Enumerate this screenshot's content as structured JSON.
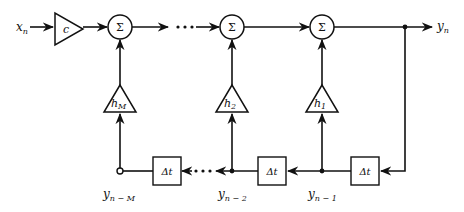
{
  "diagram": {
    "input_label": "x",
    "input_sub": "n",
    "output_label": "y",
    "output_sub": "n",
    "gain_label": "c",
    "sum_symbol": "Σ",
    "delay_label": "Δt",
    "ellipsis": "···",
    "coefficients": [
      {
        "name": "h",
        "sub": "M"
      },
      {
        "name": "h",
        "sub": "2"
      },
      {
        "name": "h",
        "sub": "1"
      }
    ],
    "taps": [
      {
        "name": "y",
        "sub": "n − M"
      },
      {
        "name": "y",
        "sub": "n − 2"
      },
      {
        "name": "y",
        "sub": "n − 1"
      }
    ],
    "colors": {
      "line": "#111111",
      "background": "#ffffff"
    }
  }
}
